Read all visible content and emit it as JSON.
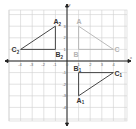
{
  "diagram": {
    "type": "coordinate-plane",
    "axes": {
      "x_label": "x",
      "y_label": "y",
      "x_range": [
        -5,
        5
      ],
      "y_range": [
        -5,
        4
      ],
      "x_ticks": [
        "-4",
        "-3",
        "-2",
        "-1",
        "0",
        "1",
        "2",
        "3",
        "4"
      ],
      "y_ticks": [
        "3",
        "2",
        "1",
        "-1",
        "-2",
        "-3",
        "-4"
      ]
    },
    "triangles": [
      {
        "name": "original",
        "color": "#b3b3b3",
        "points": [
          {
            "label": "A",
            "sub": "",
            "x": 1,
            "y": 3
          },
          {
            "label": "B",
            "sub": "",
            "x": 1,
            "y": 1
          },
          {
            "label": "C",
            "sub": "",
            "x": 4,
            "y": 1
          }
        ]
      },
      {
        "name": "image-1",
        "color": "#333333",
        "points": [
          {
            "label": "A",
            "sub": "1",
            "x": 1,
            "y": -3
          },
          {
            "label": "B",
            "sub": "1",
            "x": 1,
            "y": -1
          },
          {
            "label": "C",
            "sub": "1",
            "x": 4,
            "y": -1
          }
        ]
      },
      {
        "name": "image-2",
        "color": "#333333",
        "points": [
          {
            "label": "A",
            "sub": "2",
            "x": -1,
            "y": 3
          },
          {
            "label": "B",
            "sub": "2",
            "x": -1,
            "y": 1
          },
          {
            "label": "C",
            "sub": "2",
            "x": -4,
            "y": 1
          }
        ]
      }
    ]
  }
}
